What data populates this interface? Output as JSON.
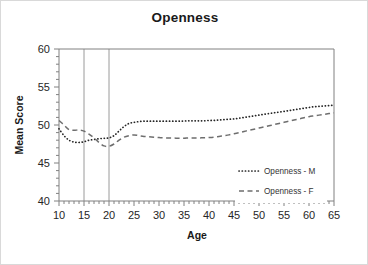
{
  "chart_data": {
    "type": "line",
    "title": "Openness",
    "xlabel": "Age",
    "ylabel": "Mean Score",
    "xlim": [
      10,
      65
    ],
    "ylim": [
      40,
      60
    ],
    "xticks": [
      10,
      15,
      20,
      25,
      30,
      35,
      40,
      45,
      50,
      55,
      60,
      65
    ],
    "yticks": [
      40,
      45,
      50,
      55,
      60
    ],
    "xminor_tick_interval": 1,
    "yminor_tick_interval": 1,
    "grid": "vertical-reference-lines-at-15-and-20",
    "vertical_reference_lines": [
      15,
      20
    ],
    "legend_position": "inside-lower-right",
    "x": [
      10,
      11,
      12,
      13,
      14,
      15,
      16,
      17,
      18,
      19,
      20,
      21,
      22,
      23,
      24,
      25,
      26,
      27,
      28,
      29,
      30,
      31,
      32,
      33,
      34,
      35,
      36,
      37,
      38,
      39,
      40,
      41,
      42,
      43,
      44,
      45,
      46,
      47,
      48,
      49,
      50,
      51,
      52,
      53,
      54,
      55,
      56,
      57,
      58,
      59,
      60,
      61,
      62,
      63,
      64,
      65
    ],
    "series": [
      {
        "name": "Openness - M",
        "linestyle": "dotted",
        "color": "#262626",
        "values": [
          49.5,
          48.6,
          48.0,
          47.75,
          47.7,
          47.8,
          48.0,
          48.1,
          48.2,
          48.25,
          48.3,
          48.6,
          49.2,
          49.8,
          50.2,
          50.35,
          50.45,
          50.5,
          50.5,
          50.5,
          50.5,
          50.5,
          50.5,
          50.5,
          50.5,
          50.52,
          50.55,
          50.55,
          50.55,
          50.55,
          50.6,
          50.6,
          50.65,
          50.7,
          50.75,
          50.8,
          50.9,
          51.0,
          51.1,
          51.2,
          51.3,
          51.4,
          51.5,
          51.6,
          51.7,
          51.8,
          51.9,
          52.0,
          52.1,
          52.2,
          52.3,
          52.4,
          52.45,
          52.5,
          52.55,
          52.6
        ],
        "endpoints": {
          "start_age": 10,
          "start_value": 49.5,
          "end_age": 65,
          "end_value": 52.6
        },
        "minimum": {
          "age": 14,
          "value": 47.7
        }
      },
      {
        "name": "Openness - F",
        "linestyle": "dashed",
        "color": "#6e6e6e",
        "values": [
          50.6,
          50.0,
          49.4,
          49.3,
          49.35,
          49.2,
          48.8,
          48.3,
          47.7,
          47.25,
          47.2,
          47.5,
          48.0,
          48.4,
          48.6,
          48.7,
          48.6,
          48.5,
          48.45,
          48.4,
          48.35,
          48.3,
          48.3,
          48.28,
          48.25,
          48.25,
          48.3,
          48.3,
          48.3,
          48.32,
          48.35,
          48.4,
          48.5,
          48.6,
          48.7,
          48.85,
          49.0,
          49.15,
          49.3,
          49.45,
          49.6,
          49.75,
          49.9,
          50.05,
          50.2,
          50.35,
          50.5,
          50.65,
          50.8,
          50.95,
          51.1,
          51.2,
          51.3,
          51.4,
          51.5,
          51.6
        ],
        "endpoints": {
          "start_age": 10,
          "start_value": 50.6,
          "end_age": 65,
          "end_value": 51.6
        },
        "minimum": {
          "age": 20,
          "value": 47.2
        }
      }
    ],
    "legend": [
      {
        "label": "Openness - M",
        "style": "dotted"
      },
      {
        "label": "Openness - F",
        "style": "dashed"
      }
    ]
  },
  "colors": {
    "background": "#ffffff",
    "card_border": "#d9d9d9",
    "axis": "#808080",
    "gridline": "#9a9a9a",
    "text": "#1a1a1a",
    "series_m": "#262626",
    "series_f": "#6e6e6e"
  }
}
